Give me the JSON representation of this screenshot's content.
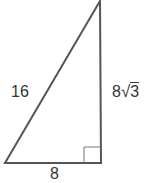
{
  "diagram": {
    "type": "right-triangle",
    "labels": {
      "hypotenuse": "16",
      "vertical_leg": "8√3",
      "base": "8"
    },
    "vertical_leg_coefficient": "8",
    "vertical_leg_radicand": "3",
    "has_right_angle_marker": true,
    "colors": {
      "stroke": "#555555",
      "text": "#333333"
    }
  }
}
